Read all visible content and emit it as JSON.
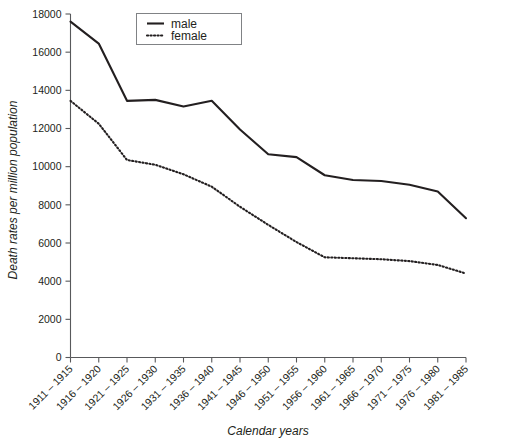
{
  "chart_data": {
    "type": "line",
    "title": "",
    "xlabel": "Calendar years",
    "ylabel": "Death rates per million population",
    "categories": [
      "1911 – 1915",
      "1916 – 1920",
      "1921 – 1925",
      "1926 – 1930",
      "1931 – 1935",
      "1936 – 1940",
      "1941 – 1945",
      "1946 – 1950",
      "1951 – 1955",
      "1956 – 1960",
      "1961 – 1965",
      "1966 – 1970",
      "1971 – 1975",
      "1976 – 1980",
      "1981 – 1985"
    ],
    "series": [
      {
        "name": "male",
        "style": "solid",
        "color": "#231f20",
        "values": [
          17600,
          16450,
          13450,
          13500,
          13150,
          13450,
          11950,
          10650,
          10500,
          9550,
          9300,
          9250,
          9050,
          8700,
          7300
        ]
      },
      {
        "name": "female",
        "style": "dotted",
        "color": "#231f20",
        "values": [
          13450,
          12250,
          10350,
          10100,
          9600,
          8950,
          7900,
          6950,
          6050,
          5250,
          5200,
          5150,
          5050,
          4850,
          4400
        ]
      }
    ],
    "ylim": [
      0,
      18000
    ],
    "yticks": [
      0,
      2000,
      4000,
      6000,
      8000,
      10000,
      12000,
      14000,
      16000,
      18000
    ],
    "ytick_labels": [
      "0",
      "2000",
      "4000",
      "6000",
      "8000",
      "10000",
      "12000",
      "14000",
      "16000",
      "18000"
    ],
    "grid": false,
    "legend_position": "top-center",
    "legend_entries": [
      "male",
      "female"
    ]
  }
}
